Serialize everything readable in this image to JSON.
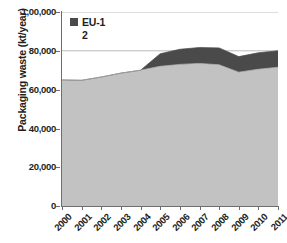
{
  "chart_data": {
    "type": "area",
    "stacked": true,
    "title": "",
    "xlabel": "",
    "ylabel": "Packaging waste (kt/year)",
    "categories": [
      "2000",
      "2001",
      "2002",
      "2003",
      "2004",
      "2005",
      "2006",
      "2007",
      "2008",
      "2009",
      "2010",
      "2011"
    ],
    "x": [
      2000,
      2001,
      2002,
      2003,
      2004,
      2005,
      2006,
      2007,
      2008,
      2009,
      2010,
      2011
    ],
    "series": [
      {
        "name": "EU-15",
        "color": "#c2c2c2",
        "in_legend": false,
        "values": [
          65000,
          64800,
          66500,
          68500,
          70000,
          72000,
          73000,
          73500,
          72800,
          69000,
          70500,
          71500
        ]
      },
      {
        "name": "EU-12",
        "color": "#4a4a4a",
        "in_legend": true,
        "values": [
          0,
          0,
          0,
          0,
          0,
          6500,
          7800,
          8200,
          8700,
          8000,
          8500,
          8500
        ]
      }
    ],
    "totals": [
      65000,
      64800,
      66500,
      68500,
      70000,
      78500,
      80800,
      81700,
      81500,
      77000,
      79000,
      80000
    ],
    "ylim": [
      0,
      100000
    ],
    "yticks": [
      0,
      20000,
      40000,
      60000,
      80000,
      100000
    ],
    "ytick_labels": [
      "0",
      "20,000",
      "40,000",
      "60,000",
      "80,000",
      "1,00,000"
    ],
    "grid": true,
    "gridlines_at": [
      80000,
      100000
    ],
    "legend_position": "top-left-inside"
  },
  "legend": {
    "entries": [
      {
        "label": "EU-12",
        "color": "#4a4a4a"
      }
    ]
  },
  "axes": {
    "y_title": "Packaging waste (kt/year)",
    "y_labels": [
      "1,00,000",
      "80,000",
      "60,000",
      "40,000",
      "20,000",
      "0"
    ],
    "x_labels": [
      "2000",
      "2001",
      "2002",
      "2003",
      "2004",
      "2005",
      "2006",
      "2007",
      "2008",
      "2009",
      "2010",
      "2011"
    ]
  },
  "colors": {
    "series_light": "#c2c2c2",
    "series_dark": "#4a4a4a",
    "axis": "#6d6e71",
    "gridline": "#a7a9ac",
    "text": "#231f20",
    "background": "#ffffff"
  }
}
